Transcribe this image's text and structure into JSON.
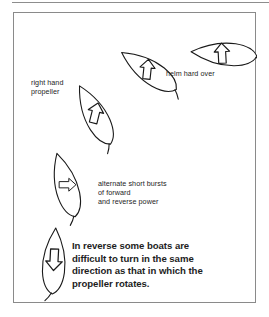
{
  "figure": {
    "frame": {
      "border_color": "#8a8a8a",
      "background": "#ffffff"
    },
    "top_rule_color": "#8d8d8d",
    "ink_color": "#1a1a1a",
    "labels": {
      "right_hand_propeller": "right hand\npropeller",
      "helm_hard_over": "helm hard over",
      "alternate_bursts": "alternate short bursts\nof forward\nand reverse power",
      "caption": "In reverse some boats are\ndifficult to turn in the same\ndirection as that in which the\npropeller rotates."
    },
    "boats": [
      {
        "name": "boat-position-1",
        "order": 1,
        "heading_label": "stern down, arrow pointing down",
        "arrow_direction": "down",
        "rotation_deg": 3,
        "center": {
          "x": 40,
          "y": 248
        }
      },
      {
        "name": "boat-position-2",
        "order": 2,
        "heading_label": "slightly turned, arrow pointing right",
        "arrow_direction": "right",
        "rotation_deg": -16,
        "center": {
          "x": 52,
          "y": 172
        }
      },
      {
        "name": "boat-position-3",
        "order": 3,
        "heading_label": "turning, arrow pointing up-right",
        "arrow_direction": "up-right",
        "rotation_deg": -28,
        "center": {
          "x": 81,
          "y": 102
        }
      },
      {
        "name": "boat-position-4",
        "order": 4,
        "heading_label": "swinging to starboard, arrow pointing right",
        "arrow_direction": "right",
        "rotation_deg": -56,
        "center": {
          "x": 135,
          "y": 58
        }
      },
      {
        "name": "boat-position-5",
        "order": 5,
        "heading_label": "broadside, arrow pointing left",
        "arrow_direction": "left",
        "rotation_deg": -86,
        "center": {
          "x": 210,
          "y": 41
        }
      }
    ]
  }
}
